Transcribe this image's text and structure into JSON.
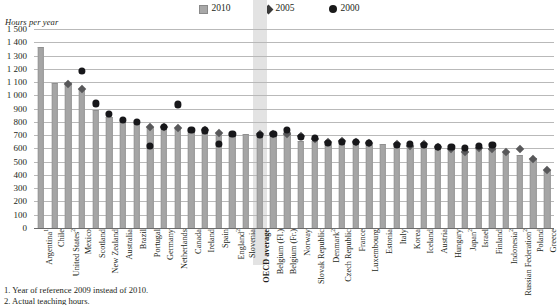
{
  "axis_title": "Hours per year",
  "legend": {
    "position": "top-center",
    "items": [
      {
        "label": "2010",
        "marker": "bar-swatch-icon",
        "color": "#a8a8a8"
      },
      {
        "label": "2005",
        "marker": "diamond-icon",
        "color": "#58585a"
      },
      {
        "label": "2000",
        "marker": "circle-icon",
        "color": "#17171a"
      }
    ]
  },
  "footnotes": [
    "1. Year of reference 2009 instead of 2010.",
    "2. Actual teaching hours."
  ],
  "highlight": {
    "category": "OECD average",
    "color": "#e3e3e3"
  },
  "chart_data": {
    "type": "bar",
    "title": "",
    "subtitle": "",
    "xlabel": "",
    "ylabel": "Hours per year",
    "ylim": [
      0,
      1500
    ],
    "ytick_step": 100,
    "yticks": [
      "0",
      "100",
      "200",
      "300",
      "400",
      "500",
      "600",
      "700",
      "800",
      "900",
      "1 000",
      "1 100",
      "1 200",
      "1 300",
      "1 400",
      "1 500"
    ],
    "grid": true,
    "categories": [
      "Argentina¹",
      "Chile",
      "United States²",
      "Mexico",
      "Scotland",
      "New Zealand",
      "Australia",
      "Brazil",
      "Portugal",
      "Germany",
      "Netherlands",
      "Canada",
      "Ireland",
      "Spain",
      "England²",
      "Slovenia",
      "OECD average",
      "Belgium (Fl.)",
      "Belgium (Fr.)",
      "Norway",
      "Slovak Republic",
      "Denmark²",
      "Czech Republic",
      "France",
      "Luxembourg",
      "Estonia",
      "Italy",
      "Korea",
      "Iceland",
      "Austria",
      "Hungary",
      "Japan²",
      "Israel",
      "Finland",
      "Indonesia²",
      "Russian Federation²",
      "Poland",
      "Greece"
    ],
    "series": [
      {
        "name": "2010",
        "marker": "bar",
        "color": "#a5a5a5",
        "values": [
          1368,
          1090,
          1097,
          1047,
          893,
          840,
          812,
          800,
          758,
          758,
          750,
          740,
          735,
          713,
          705,
          705,
          703,
          724,
          724,
          654,
          658,
          650,
          647,
          642,
          639,
          630,
          627,
          617,
          624,
          607,
          604,
          602,
          599,
          595,
          570,
          552,
          524,
          435
        ]
      },
      {
        "name": "2005",
        "marker": "diamond",
        "color": "#58585a",
        "values": [
          null,
          null,
          1080,
          1047,
          null,
          null,
          null,
          null,
          757,
          757,
          751,
          null,
          735,
          710,
          null,
          null,
          703,
          703,
          703,
          688,
          670,
          644,
          650,
          647,
          637,
          null,
          630,
          617,
          630,
          608,
          590,
          570,
          600,
          596,
          570,
          595,
          520,
          437
        ]
      },
      {
        "name": "2000",
        "marker": "circle",
        "color": "#17171a",
        "values": [
          null,
          null,
          null,
          1182,
          938,
          860,
          812,
          800,
          620,
          758,
          930,
          740,
          735,
          630,
          705,
          null,
          703,
          710,
          740,
          688,
          680,
          640,
          650,
          647,
          639,
          null,
          627,
          630,
          624,
          607,
          612,
          600,
          620,
          625,
          null,
          null,
          null,
          null
        ]
      }
    ]
  }
}
